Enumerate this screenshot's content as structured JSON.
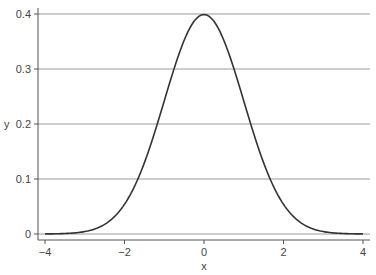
{
  "chart_data": {
    "type": "line",
    "title": "",
    "xlabel": "x",
    "ylabel": "y",
    "xlim": [
      -4,
      4
    ],
    "ylim": [
      0,
      0.4
    ],
    "grid": {
      "horizontal": true,
      "vertical": false
    },
    "legend": null,
    "x_ticks": [
      -4,
      -2,
      0,
      2,
      4
    ],
    "x_tick_labels": [
      "−4",
      "−2",
      "0",
      "2",
      "4"
    ],
    "y_ticks": [
      0,
      0.1,
      0.2,
      0.3,
      0.4
    ],
    "y_tick_labels": [
      "0",
      "0.1",
      "0.2",
      "0.3",
      "0.4"
    ],
    "series": [
      {
        "name": "standard normal density",
        "color": "#333333",
        "x": [
          -4,
          -3.5,
          -3,
          -2.5,
          -2,
          -1.5,
          -1,
          -0.5,
          0,
          0.5,
          1,
          1.5,
          2,
          2.5,
          3,
          3.5,
          4
        ],
        "values": [
          0.0001,
          0.0009,
          0.0044,
          0.0175,
          0.054,
          0.1295,
          0.242,
          0.3521,
          0.3989,
          0.3521,
          0.242,
          0.1295,
          0.054,
          0.0175,
          0.0044,
          0.0009,
          0.0001
        ]
      }
    ]
  },
  "colors": {
    "curve": "#333333",
    "grid": "#9a9a9a",
    "axis": "#555555",
    "text": "#444444"
  }
}
